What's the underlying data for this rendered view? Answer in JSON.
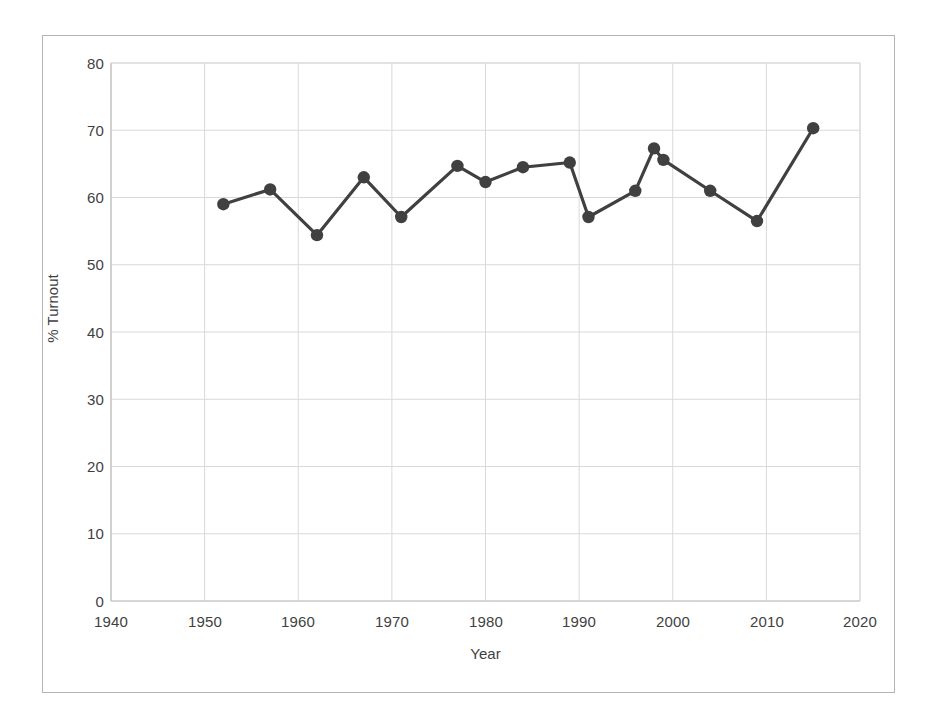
{
  "chart_data": {
    "type": "line",
    "title": "",
    "subtitle": "",
    "xlabel": "Year",
    "ylabel": "% Turnout",
    "xlim": [
      1940,
      2020
    ],
    "ylim": [
      0,
      80
    ],
    "xticks": [
      1940,
      1950,
      1960,
      1970,
      1980,
      1990,
      2000,
      2010,
      2020
    ],
    "yticks": [
      0,
      10,
      20,
      30,
      40,
      50,
      60,
      70,
      80
    ],
    "grid": true,
    "legend": "none",
    "marker": "filled-circle",
    "line_color": "#404040",
    "marker_color": "#404040",
    "grid_color": "#d9d9d9",
    "x": [
      1952,
      1957,
      1962,
      1967,
      1971,
      1977,
      1980,
      1984,
      1989,
      1991,
      1996,
      1998,
      1999,
      2004,
      2009,
      2015
    ],
    "values": [
      59.0,
      61.2,
      54.4,
      63.0,
      57.1,
      64.7,
      62.3,
      64.5,
      65.2,
      57.1,
      61.0,
      67.3,
      65.6,
      61.0,
      56.5,
      70.3
    ],
    "series": [
      {
        "name": "% Turnout",
        "points": [
          {
            "x": 1952,
            "y": 59.0
          },
          {
            "x": 1957,
            "y": 61.2
          },
          {
            "x": 1962,
            "y": 54.4
          },
          {
            "x": 1967,
            "y": 63.0
          },
          {
            "x": 1971,
            "y": 57.1
          },
          {
            "x": 1977,
            "y": 64.7
          },
          {
            "x": 1980,
            "y": 62.3
          },
          {
            "x": 1984,
            "y": 64.5
          },
          {
            "x": 1989,
            "y": 65.2
          },
          {
            "x": 1991,
            "y": 57.1
          },
          {
            "x": 1996,
            "y": 61.0
          },
          {
            "x": 1998,
            "y": 67.3
          },
          {
            "x": 1999,
            "y": 65.6
          },
          {
            "x": 2004,
            "y": 61.0
          },
          {
            "x": 2009,
            "y": 56.5
          },
          {
            "x": 2015,
            "y": 70.3
          }
        ]
      }
    ]
  },
  "axis": {
    "y_tick_labels": [
      "80",
      "70",
      "60",
      "50",
      "40",
      "30",
      "20",
      "10",
      "0"
    ],
    "x_tick_labels": [
      "1940",
      "1950",
      "1960",
      "1970",
      "1980",
      "1990",
      "2000",
      "2010",
      "2020"
    ],
    "y_title": "% Turnout",
    "x_title": "Year"
  }
}
